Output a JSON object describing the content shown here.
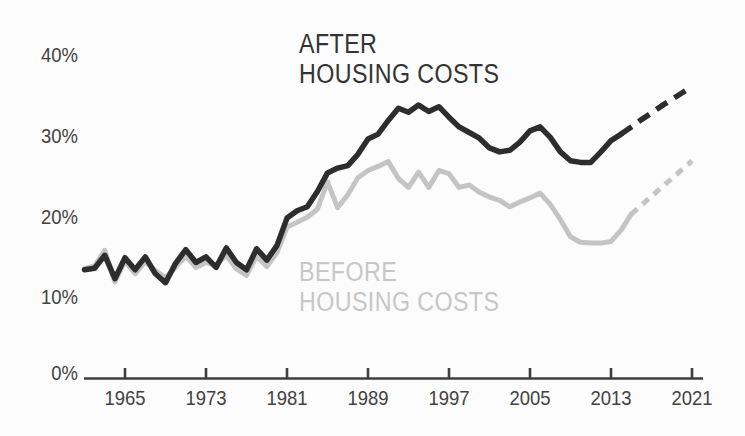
{
  "chart_data": {
    "type": "line",
    "title": "",
    "unit": "percent",
    "legend_position": "inline-labels",
    "grid": false,
    "x_axis": {
      "ticks": [
        "1965",
        "1973",
        "1981",
        "1989",
        "1997",
        "2005",
        "2013",
        "2021"
      ],
      "range": [
        1961,
        2021
      ]
    },
    "y_axis": {
      "ticks": [
        "40%",
        "30%",
        "20%",
        "10%",
        "0%"
      ],
      "tick_values": [
        40,
        30,
        20,
        10,
        0
      ],
      "range": [
        0,
        40
      ]
    },
    "colors": {
      "after": "#2d2d2d",
      "before": "#c4c4c4",
      "axis": "#3f3f3f"
    },
    "series": [
      {
        "name": "BEFORE HOUSING COSTS",
        "label_line1": "BEFORE",
        "label_line2": "HOUSING COSTS",
        "color": "#c4c4c4",
        "solid": {
          "years": [
            1961,
            1962,
            1963,
            1964,
            1965,
            1966,
            1967,
            1968,
            1969,
            1970,
            1971,
            1972,
            1973,
            1974,
            1975,
            1976,
            1977,
            1978,
            1979,
            1980,
            1981,
            1982,
            1983,
            1984,
            1985,
            1986,
            1987,
            1988,
            1989,
            1990,
            1991,
            1992,
            1993,
            1994,
            1995,
            1996,
            1997,
            1998,
            1999,
            2000,
            2001,
            2002,
            2003,
            2004,
            2005,
            2006,
            2007,
            2008,
            2009,
            2010,
            2011,
            2012,
            2013,
            2014,
            2015
          ],
          "values": [
            13.5,
            13.9,
            15.8,
            11.9,
            14.5,
            12.9,
            14.4,
            13.3,
            12.4,
            13.7,
            15.1,
            13.7,
            14.3,
            14.0,
            15.2,
            13.5,
            12.7,
            15.1,
            13.8,
            15.5,
            18.7,
            19.3,
            19.9,
            20.9,
            24.3,
            21.1,
            22.7,
            24.8,
            25.7,
            26.2,
            26.8,
            24.7,
            23.6,
            25.5,
            23.6,
            25.7,
            25.3,
            23.6,
            23.9,
            23.0,
            22.4,
            22.0,
            21.2,
            21.8,
            22.3,
            22.9,
            21.5,
            19.6,
            17.5,
            16.8,
            16.7,
            16.7,
            16.9,
            18.3,
            20.3
          ]
        },
        "projected": {
          "years": [
            2015,
            2016,
            2017,
            2018,
            2019,
            2020,
            2021
          ],
          "values": [
            20.3,
            21.4,
            22.5,
            23.6,
            24.7,
            25.8,
            26.9
          ]
        }
      },
      {
        "name": "AFTER HOUSING COSTS",
        "label_line1": "AFTER",
        "label_line2": "HOUSING COSTS",
        "color": "#2d2d2d",
        "solid": {
          "years": [
            1961,
            1962,
            1963,
            1964,
            1965,
            1966,
            1967,
            1968,
            1969,
            1970,
            1971,
            1972,
            1973,
            1974,
            1975,
            1976,
            1977,
            1978,
            1979,
            1980,
            1981,
            1982,
            1983,
            1984,
            1985,
            1986,
            1987,
            1988,
            1989,
            1990,
            1991,
            1992,
            1993,
            1994,
            1995,
            1996,
            1997,
            1998,
            1999,
            2000,
            2001,
            2002,
            2003,
            2004,
            2005,
            2006,
            2007,
            2008,
            2009,
            2010,
            2011,
            2012,
            2013,
            2014
          ],
          "values": [
            13.4,
            13.6,
            15.2,
            12.3,
            14.9,
            13.4,
            15.0,
            12.9,
            11.8,
            14.2,
            15.9,
            14.3,
            15.0,
            13.7,
            16.1,
            14.3,
            13.4,
            16.0,
            14.6,
            16.4,
            19.8,
            20.7,
            21.2,
            23.1,
            25.4,
            26.0,
            26.3,
            27.7,
            29.6,
            30.2,
            31.9,
            33.4,
            32.9,
            33.8,
            33.0,
            33.6,
            32.3,
            31.1,
            30.4,
            29.7,
            28.5,
            28.0,
            28.2,
            29.2,
            30.6,
            31.1,
            29.8,
            28.0,
            26.9,
            26.7,
            26.7,
            28.0,
            29.4,
            30.2
          ]
        },
        "projected": {
          "years": [
            2014,
            2015,
            2016,
            2017,
            2018,
            2019,
            2020,
            2021
          ],
          "values": [
            30.2,
            31.1,
            32.0,
            32.8,
            33.7,
            34.5,
            35.3,
            36.1
          ]
        }
      }
    ]
  }
}
